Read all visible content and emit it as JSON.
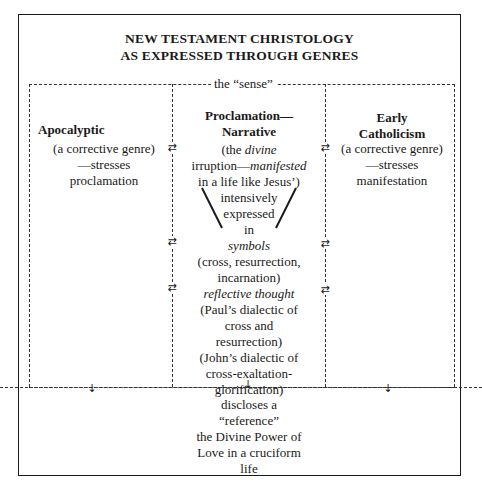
{
  "title": {
    "line1": "NEW TESTAMENT CHRISTOLOGY",
    "line2": "AS EXPRESSED THROUGH GENRES"
  },
  "sense_label": "the “sense”",
  "columns": {
    "left": {
      "heading": "Apocalyptic",
      "line1": "(a corrective genre)",
      "line2": "—stresses",
      "line3": "proclamation"
    },
    "center": {
      "heading1": "Proclamation—",
      "heading2": "Narrative",
      "l1_a": "(the ",
      "l1_b": "divine",
      "l2_a": "irruption—",
      "l2_b": "manifested",
      "l3": "in a life like Jesus’)",
      "l4": "intensively",
      "l5": "expressed",
      "l6": "in",
      "l7": "symbols",
      "l8": "(cross, resurrection,",
      "l9": "incarnation)",
      "l10": "reflective thought",
      "l11": "(Paul’s dialectic of",
      "l12": "cross and",
      "l13": "resurrection)",
      "l14": "(John’s dialectic of",
      "l15": "cross-exaltation-",
      "l16": "glorification)"
    },
    "right": {
      "heading1": "Early",
      "heading2": "Catholicism",
      "line1": "(a corrective genre)",
      "line2": "—stresses",
      "line3": "manifestation"
    }
  },
  "result": {
    "l1": "discloses a",
    "l2": "“reference”",
    "l3": "the Divine Power of",
    "l4": "Love in a cruciform",
    "l5": "life"
  },
  "icons": {
    "exchange": "⇄",
    "down": "↓"
  }
}
